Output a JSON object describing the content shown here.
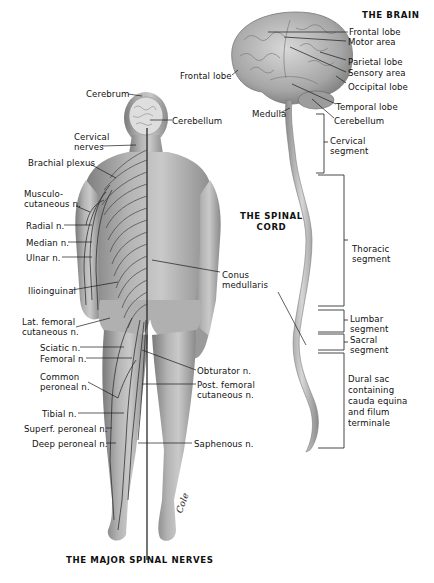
{
  "titles": {
    "brain": "THE BRAIN",
    "spinal_cord": "THE SPINAL\nCORD",
    "major_nerves": "THE MAJOR SPINAL NERVES"
  },
  "brain_labels": {
    "frontal_lobe_right": "Frontal lobe",
    "motor_area": "Motor area",
    "parietal_lobe": "Parietal lobe",
    "sensory_area": "Sensory area",
    "occipital_lobe": "Occipital lobe",
    "frontal_lobe_left": "Frontal lobe",
    "medulla": "Medulla",
    "temporal_lobe": "Temporal lobe",
    "cerebellum": "Cerebellum"
  },
  "spinal_segments": {
    "cervical": "Cervical\nsegment",
    "thoracic": "Thoracic\nsegment",
    "lumbar": "Lumbar\nsegment",
    "sacral": "Sacral\nsegment",
    "dural_sac": "Dural sac\ncontaining\ncauda equina\nand filum\nterminale"
  },
  "body_labels": {
    "cerebrum": "Cerebrum",
    "cerebellum": "Cerebellum",
    "cervical_nerves": "Cervical\nnerves",
    "brachial_plexus": "Brachial plexus",
    "musculocutaneous": "Musculo-\ncutaneous n.",
    "radial": "Radial n.",
    "median": "Median n.",
    "ulnar": "Ulnar n.",
    "ilioinguinal": "Ilioinguinal",
    "conus_medullaris": "Conus\nmedullaris",
    "lat_femoral_cutaneous": "Lat. femoral\ncutaneous n.",
    "sciatic": "Sciatic n.",
    "femoral": "Femoral n.",
    "obturator": "Obturator n.",
    "common_peroneal": "Common\nperoneal n.",
    "post_femoral_cutaneous": "Post. femoral\ncutaneous n.",
    "tibial": "Tibial n.",
    "superf_peroneal": "Superf. peroneal n.",
    "deep_peroneal": "Deep peroneal n.",
    "saphenous": "Saphenous n."
  },
  "signature": "Cole",
  "colors": {
    "skin_light": "#d8d8d8",
    "skin_mid": "#a8a8a8",
    "skin_dark": "#6e6e6e",
    "nerve": "#3a3a3a",
    "leader": "#1a1a1a"
  }
}
